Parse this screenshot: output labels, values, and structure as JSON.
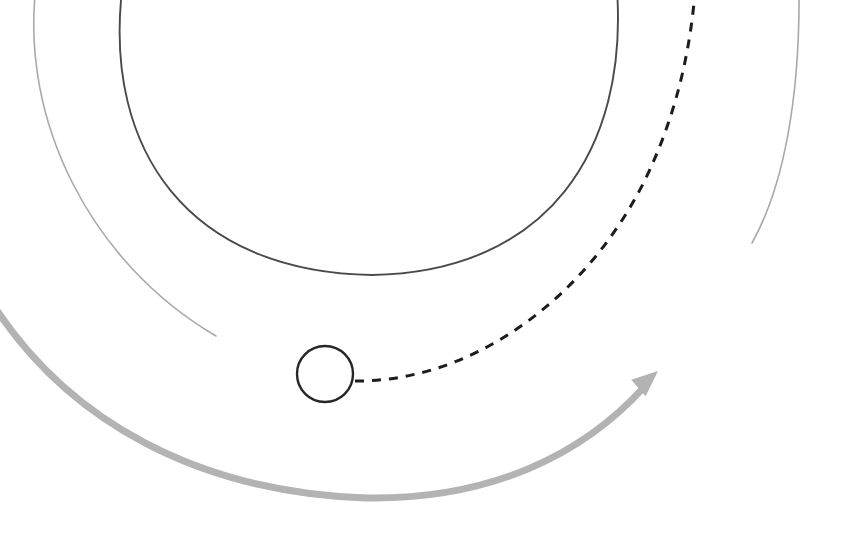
{
  "canvas": {
    "width": 843,
    "height": 540,
    "background": "#ffffff",
    "title": "Orbital arc diagram"
  },
  "palette": {
    "faint_gray": "#a9a9a9",
    "dark_stroke": "#4a4a4a",
    "dashed_stroke": "#1c1c1c",
    "circle_stroke": "#262626",
    "thick_gray": "#b3b3b3",
    "background": "#ffffff"
  },
  "chart_data": {
    "type": "diagram",
    "xlabel": "",
    "ylabel": "",
    "xlim": [
      0,
      843
    ],
    "ylim": [
      0,
      540
    ],
    "grid": false,
    "legend": "none",
    "annotations": [],
    "elements": [
      {
        "name": "outer-left-faint-arc",
        "kind": "arc",
        "style": "solid",
        "color": "#a9a9a9",
        "stroke_width": 1.6,
        "path": "M 36 -14 C 20 120 90 262 216 336",
        "start_point": [
          36,
          0
        ],
        "end_point": [
          216,
          336
        ]
      },
      {
        "name": "inner-dark-semicircle-arc",
        "kind": "arc",
        "style": "solid",
        "color": "#4a4a4a",
        "stroke_width": 1.9,
        "path": "M 122 -10 C 104 150 188 272 372 275 C 548 272 628 150 617 -10",
        "start_point": [
          122,
          0
        ],
        "end_point": [
          617,
          0
        ],
        "lowest_point": [
          372,
          275
        ]
      },
      {
        "name": "outer-right-faint-arc",
        "kind": "arc",
        "style": "solid",
        "color": "#a9a9a9",
        "stroke_width": 1.6,
        "path": "M 799 -10 C 800 96 784 186 752 243",
        "start_point": [
          799,
          0
        ],
        "end_point": [
          752,
          243
        ]
      },
      {
        "name": "dashed-trajectory-curve",
        "kind": "curve",
        "style": "dashed",
        "color": "#1c1c1c",
        "stroke_width": 3.0,
        "dash_on": 9,
        "dash_off": 8,
        "path": "M 355 381 C 470 382 584 302 645 180 C 676 116 690 52 695 -8",
        "start_point": [
          355,
          381
        ],
        "end_point": [
          695,
          0
        ]
      },
      {
        "name": "small-body-circle",
        "kind": "circle",
        "style": "solid",
        "color": "#262626",
        "stroke_width": 2.4,
        "fill": "none",
        "center": [
          325,
          374
        ],
        "radius": 28
      },
      {
        "name": "thick-gray-arrow",
        "kind": "arrow",
        "style": "solid",
        "color": "#b3b3b3",
        "stroke_width": 7,
        "path": "M -4 309 C 70 420 196 492 366 498 C 490 500 583 455 645 386",
        "start_point": [
          0,
          310
        ],
        "end_point": [
          645,
          386
        ],
        "lowest_point": [
          366,
          498
        ],
        "arrowhead": {
          "tip": [
            658,
            371
          ],
          "angle_deg": -41,
          "length": 26,
          "width": 22
        }
      }
    ]
  }
}
